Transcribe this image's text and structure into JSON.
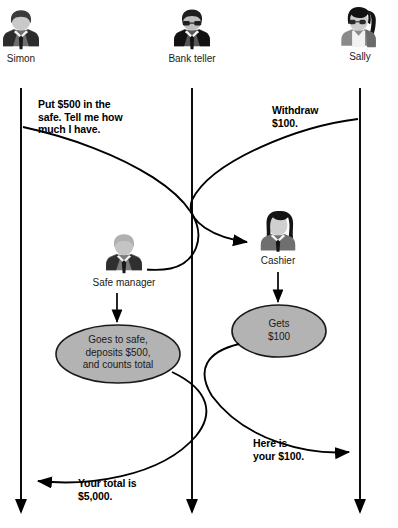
{
  "diagram": {
    "type": "sequence-diagram",
    "background": "#ffffff",
    "line_color": "#000000",
    "oval_fill": "#b3b3b3",
    "oval_stroke": "#1a1a1a"
  },
  "actors": [
    {
      "id": "simon",
      "name": "Simon",
      "avatar": "man-suit-avatar-icon",
      "lifeline_x": 21
    },
    {
      "id": "bank_teller",
      "name": "Bank teller",
      "avatar": "man-glasses-suit-avatar-icon",
      "lifeline_x": 192
    },
    {
      "id": "sally",
      "name": "Sally",
      "avatar": "woman-ponytail-glasses-avatar-icon",
      "lifeline_x": 360
    },
    {
      "id": "safe_manager",
      "name": "Safe manager",
      "avatar": "man-light-suit-avatar-icon",
      "lifeline_x": 117
    },
    {
      "id": "cashier",
      "name": "Cashier",
      "avatar": "woman-long-hair-avatar-icon",
      "lifeline_x": 278
    }
  ],
  "messages": [
    {
      "id": "m1",
      "text": "Put $500 in the\nsafe. Tell me how\nmuch I have.",
      "from": "simon",
      "to": "safe_manager"
    },
    {
      "id": "m2",
      "text": "Withdraw\n$100.",
      "from": "sally",
      "to": "cashier"
    },
    {
      "id": "m3",
      "text": "Here is\nyour $100.",
      "from": "cashier",
      "to": "sally"
    },
    {
      "id": "m4",
      "text": "Your total is\n$5,000.",
      "from": "safe_manager",
      "to": "simon"
    }
  ],
  "message_lines": {
    "m1": [
      "Put $500 in the",
      "safe. Tell me how",
      "much I have."
    ],
    "m2": [
      "Withdraw",
      "$100."
    ],
    "m3": [
      "Here is",
      "your $100."
    ],
    "m4": [
      "Your total is",
      "$5,000."
    ]
  },
  "activities": [
    {
      "id": "a1",
      "owner": "safe_manager",
      "lines": [
        "Goes to safe,",
        "deposits $500,",
        "and counts total"
      ]
    },
    {
      "id": "a2",
      "owner": "cashier",
      "lines": [
        "Gets",
        "$100"
      ]
    }
  ]
}
